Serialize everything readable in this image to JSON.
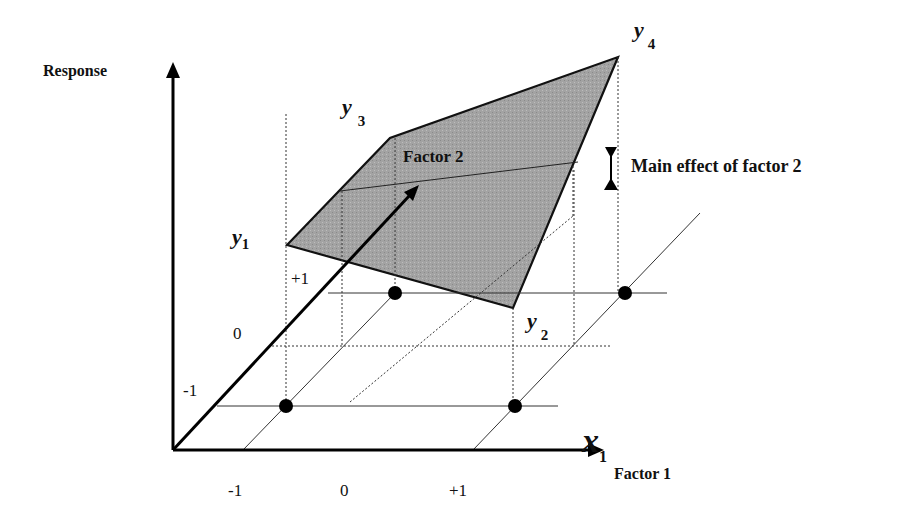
{
  "diagram": {
    "axes": {
      "vertical": {
        "label": "Response"
      },
      "horizontal": {
        "symbol": "x",
        "subscript": "1",
        "label": "Factor 1",
        "ticks": [
          "-1",
          "0",
          "+1"
        ]
      },
      "depth": {
        "label": "Factor 2",
        "ticks": [
          "-1",
          "0",
          "+1"
        ]
      }
    },
    "responses": [
      {
        "symbol": "y",
        "subscript": "1"
      },
      {
        "symbol": "y",
        "subscript": "2"
      },
      {
        "symbol": "y",
        "subscript": "3"
      },
      {
        "symbol": "y",
        "subscript": "4"
      }
    ],
    "annotation": "Main effect of factor 2",
    "colors": {
      "surface_fill": "#9a9a9a",
      "line": "#111111",
      "background": "#ffffff"
    }
  }
}
